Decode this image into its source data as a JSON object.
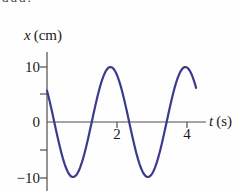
{
  "artifact": {
    "text": "ddd."
  },
  "colors": {
    "curve": "#3b3b8c",
    "axis": "#4d4d4d",
    "text": "#1a1a1a",
    "background": "#fefefe"
  },
  "chart_data": {
    "type": "line",
    "title": "",
    "xlabel": "t (s)",
    "xlabel_var": "t",
    "xlabel_unit": "(s)",
    "ylabel": "x (cm)",
    "ylabel_var": "x",
    "ylabel_unit": "(cm)",
    "xlim": [
      0,
      4.6
    ],
    "ylim": [
      -12.5,
      13
    ],
    "grid": false,
    "legend": null,
    "x_ticks": [
      {
        "t": 2,
        "label": "2"
      },
      {
        "t": 4,
        "label": "4"
      }
    ],
    "y_ticks_labeled": [
      {
        "x": 10,
        "label": "10"
      },
      {
        "x": 0,
        "label": "0"
      },
      {
        "x": -10,
        "label": "−10"
      }
    ],
    "y_ticks_minor": [
      5,
      -5
    ],
    "series": [
      {
        "name": "position x versus time t (simple harmonic motion)",
        "color": "#3b3b8c",
        "model": {
          "kind": "sinusoid",
          "amplitude_cm": 10,
          "period_s": 2.14,
          "phase_rad": 2.531,
          "t_start_s": 0,
          "t_end_s": 4.26
        },
        "points_t_s": [
          0,
          0.25,
          0.5,
          0.75,
          1.0,
          1.25,
          1.5,
          1.75,
          2.0,
          2.25,
          2.5,
          2.75,
          3.0,
          3.25,
          3.5,
          3.75,
          4.0,
          4.25
        ],
        "points_x_cm": [
          5.7,
          -1.2,
          -7.6,
          -10.0,
          -7.2,
          -0.8,
          6.1,
          9.8,
          8.5,
          2.8,
          -4.3,
          -9.3,
          -9.5,
          -4.8,
          2.4,
          8.3,
          9.9,
          6.4
        ]
      }
    ]
  }
}
